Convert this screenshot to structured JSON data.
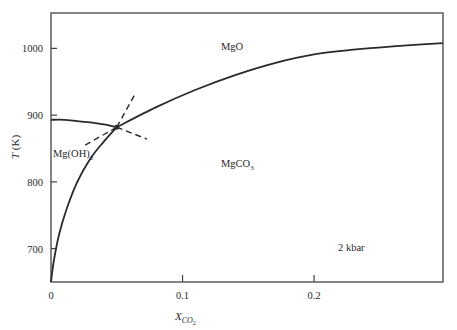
{
  "chart_data": {
    "type": "line",
    "title": "",
    "xlabel": "X",
    "xlabel_sub": "CO",
    "xlabel_subsub": "2",
    "ylabel": "T (K)",
    "xlim": [
      0,
      0.298
    ],
    "ylim": [
      650,
      1053
    ],
    "x_ticks": [
      {
        "value": 0,
        "label": "0"
      },
      {
        "value": 0.1,
        "label": "0.1"
      },
      {
        "value": 0.2,
        "label": "0.2"
      }
    ],
    "y_ticks": [
      {
        "value": 700,
        "label": "700"
      },
      {
        "value": 800,
        "label": "800"
      },
      {
        "value": 900,
        "label": "900"
      },
      {
        "value": 1000,
        "label": "1000"
      }
    ],
    "grid": false,
    "legend": null,
    "series": [
      {
        "name": "Mg(OH)2 = MgO + H2O",
        "style": "solid",
        "x": [
          0,
          0.01,
          0.02,
          0.03,
          0.04,
          0.05
        ],
        "y": [
          893,
          893,
          891,
          889,
          886,
          882
        ]
      },
      {
        "name": "Mg(OH)2 + CO2 = MgCO3 + H2O",
        "style": "solid",
        "x": [
          0.0,
          0.002,
          0.006,
          0.012,
          0.02,
          0.03,
          0.04,
          0.05
        ],
        "y": [
          650,
          680,
          720,
          760,
          800,
          835,
          860,
          882
        ]
      },
      {
        "name": "MgCO3 = MgO + CO2",
        "style": "solid",
        "x": [
          0.05,
          0.08,
          0.11,
          0.14,
          0.17,
          0.2,
          0.23,
          0.26,
          0.298
        ],
        "y": [
          882,
          912,
          938,
          960,
          978,
          991,
          998,
          1003,
          1008
        ]
      },
      {
        "name": "metastable extension (MgO / Mg(OH)2 into MgCO3 field)",
        "style": "dashed",
        "x": [
          0.05,
          0.073
        ],
        "y": [
          882,
          864
        ]
      },
      {
        "name": "metastable extension (MgCO3 / MgO into Mg(OH)2 field)",
        "style": "dashed",
        "x": [
          0.026,
          0.05
        ],
        "y": [
          855,
          882
        ]
      },
      {
        "name": "metastable extension (Mg(OH)2 / MgCO3 into MgO field)",
        "style": "dashed",
        "x": [
          0.05,
          0.064
        ],
        "y": [
          882,
          932
        ]
      }
    ],
    "invariant_point": {
      "x": 0.05,
      "y": 882
    },
    "annotations": [
      {
        "text": "MgO",
        "x": 0.14,
        "y": 1000
      },
      {
        "text": "MgCO",
        "sub": "3",
        "x": 0.14,
        "y": 845
      },
      {
        "text": "Mg(OH)",
        "sub": "2",
        "x": 0.0,
        "y": 851
      },
      {
        "text": "2 kbar",
        "x": 0.23,
        "y": 712
      }
    ]
  },
  "labels": {
    "y_axis_main": "T",
    "y_axis_unit": " (K)",
    "x_axis_main": "X",
    "x_axis_sub": "CO",
    "x_axis_subsub": "2",
    "field_mgo": "MgO",
    "field_mgco3": "MgCO",
    "field_mgco3_sub": "3",
    "field_mgoh2": "Mg(OH)",
    "field_mgoh2_sub": "2",
    "pressure": "2 kbar"
  },
  "colors": {
    "line": "#2a2a2a",
    "frame": "#444444",
    "text": "#2a2a2a",
    "background": "#ffffff"
  }
}
